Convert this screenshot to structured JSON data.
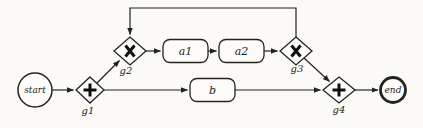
{
  "diagram": {
    "colors": {
      "background": "#fbfaf7",
      "stroke": "#24241f",
      "node_fill": "#fdfcfa"
    },
    "nodes": {
      "start": {
        "label": "start",
        "type": "start-event"
      },
      "g1": {
        "label": "g1",
        "type": "gateway",
        "symbol": "plus"
      },
      "g2": {
        "label": "g2",
        "type": "gateway",
        "symbol": "cross"
      },
      "g3": {
        "label": "g3",
        "type": "gateway",
        "symbol": "cross"
      },
      "g4": {
        "label": "g4",
        "type": "gateway",
        "symbol": "plus"
      },
      "a1": {
        "label": "a1",
        "type": "task"
      },
      "a2": {
        "label": "a2",
        "type": "task"
      },
      "b": {
        "label": "b",
        "type": "task"
      },
      "end": {
        "label": "end",
        "type": "end-event"
      }
    },
    "edges": [
      {
        "from": "start",
        "to": "g1"
      },
      {
        "from": "g1",
        "to": "g2"
      },
      {
        "from": "g1",
        "to": "b"
      },
      {
        "from": "g2",
        "to": "a1"
      },
      {
        "from": "a1",
        "to": "a2"
      },
      {
        "from": "a2",
        "to": "g3"
      },
      {
        "from": "g3",
        "to": "g2",
        "note": "loop-back-over-top"
      },
      {
        "from": "g3",
        "to": "g4"
      },
      {
        "from": "b",
        "to": "g4"
      },
      {
        "from": "g4",
        "to": "end"
      }
    ]
  }
}
